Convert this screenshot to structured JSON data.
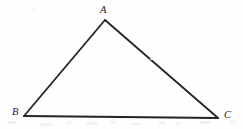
{
  "figure": {
    "kind": "geometry-diagram",
    "shape": "triangle",
    "background_color": "#fefefe",
    "stroke_color": "#242424",
    "stroke_width": 1.8,
    "label_color": "#242424",
    "canvas": {
      "width": 243,
      "height": 129
    },
    "vertices": [
      {
        "id": "A",
        "label": "A",
        "x": 105,
        "y": 20,
        "label_x": 100,
        "label_y": 5
      },
      {
        "id": "B",
        "label": "B",
        "x": 24,
        "y": 116,
        "label_x": 12,
        "label_y": 107
      },
      {
        "id": "C",
        "label": "C",
        "x": 218,
        "y": 118,
        "label_x": 224,
        "label_y": 110
      }
    ],
    "edges": [
      {
        "id": "AB",
        "from": "A",
        "to": "B"
      },
      {
        "id": "AC",
        "from": "A",
        "to": "C"
      },
      {
        "id": "BC",
        "from": "B",
        "to": "C"
      }
    ],
    "speckles": [
      {
        "x": 8,
        "y": 121,
        "w": 9,
        "h": 3
      },
      {
        "x": 40,
        "y": 123,
        "w": 14,
        "h": 3
      },
      {
        "x": 66,
        "y": 121,
        "w": 7,
        "h": 3
      },
      {
        "x": 86,
        "y": 122,
        "w": 12,
        "h": 3
      },
      {
        "x": 110,
        "y": 121,
        "w": 6,
        "h": 3
      },
      {
        "x": 131,
        "y": 123,
        "w": 10,
        "h": 2
      },
      {
        "x": 158,
        "y": 121,
        "w": 8,
        "h": 3
      },
      {
        "x": 176,
        "y": 122,
        "w": 5,
        "h": 2
      },
      {
        "x": 200,
        "y": 121,
        "w": 11,
        "h": 3
      },
      {
        "x": 229,
        "y": 120,
        "w": 7,
        "h": 3
      },
      {
        "x": 30,
        "y": 9,
        "w": 5,
        "h": 2
      },
      {
        "x": 150,
        "y": 58,
        "w": 4,
        "h": 2
      }
    ]
  }
}
